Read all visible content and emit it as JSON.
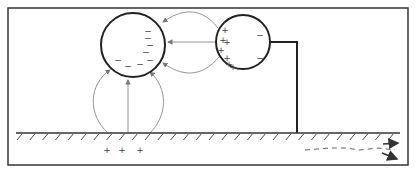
{
  "diagram": {
    "frame": {
      "x": 8,
      "y": 8,
      "w": 400,
      "h": 157,
      "color": "#333333"
    },
    "colors": {
      "stroke": "#222222",
      "field": "#777777",
      "ground": "#333333",
      "charge": "#444444"
    },
    "spheres": [
      {
        "id": "left-sphere",
        "cx": 133,
        "cy": 45,
        "r": 32,
        "charges": [
          {
            "sign": "−",
            "x": 148,
            "y": 38
          },
          {
            "sign": "−",
            "x": 150,
            "y": 45
          },
          {
            "sign": "−",
            "x": 146,
            "y": 52
          },
          {
            "sign": "−",
            "x": 148,
            "y": 31
          },
          {
            "sign": "−",
            "x": 118,
            "y": 60
          },
          {
            "sign": "−",
            "x": 128,
            "y": 66
          },
          {
            "sign": "−",
            "x": 140,
            "y": 64
          },
          {
            "sign": "−",
            "x": 150,
            "y": 60
          }
        ]
      },
      {
        "id": "right-sphere",
        "cx": 243,
        "cy": 42,
        "r": 27,
        "charges": [
          {
            "sign": "+",
            "x": 225,
            "y": 30
          },
          {
            "sign": "+",
            "x": 223,
            "y": 40
          },
          {
            "sign": "+",
            "x": 227,
            "y": 42
          },
          {
            "sign": "+",
            "x": 221,
            "y": 50
          },
          {
            "sign": "+",
            "x": 227,
            "y": 58
          },
          {
            "sign": "+",
            "x": 229,
            "y": 64
          },
          {
            "sign": "+",
            "x": 233,
            "y": 67
          },
          {
            "sign": "−",
            "x": 260,
            "y": 35
          },
          {
            "sign": "−",
            "x": 260,
            "y": 58
          }
        ]
      }
    ],
    "ground": {
      "y": 133,
      "x1": 16,
      "x2": 400,
      "hatch_count": 30
    },
    "ground_charges": [
      {
        "sign": "+",
        "x": 107,
        "y": 150
      },
      {
        "sign": "+",
        "x": 122,
        "y": 150
      },
      {
        "sign": "+",
        "x": 140,
        "y": 150
      }
    ],
    "wire": {
      "points": "270,42 297,42 297,133"
    },
    "current_arrows": {
      "dashed_path": "305,150 330,148 345,148 360,150 378,148 395,150",
      "arrow_heads": [
        {
          "x1": 383,
          "y1": 144,
          "x2": 398,
          "y2": 143
        },
        {
          "x1": 382,
          "y1": 153,
          "x2": 397,
          "y2": 159
        }
      ]
    }
  }
}
